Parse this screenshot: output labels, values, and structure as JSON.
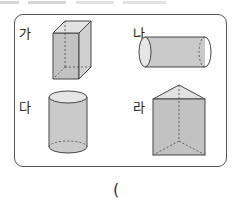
{
  "cutoff_text": "",
  "figures": [
    {
      "id": "ga",
      "label": "가",
      "shape": "rectangular prism (cuboid)"
    },
    {
      "id": "na",
      "label": "나",
      "shape": "cylinder (horizontal)"
    },
    {
      "id": "da",
      "label": "다",
      "shape": "cylinder (vertical)"
    },
    {
      "id": "ra",
      "label": "라",
      "shape": "triangular prism"
    }
  ],
  "answer_blank": "(",
  "colors": {
    "fill": "#c8c8c8",
    "fill_light": "#dedede",
    "stroke": "#444444",
    "border": "#555555"
  }
}
